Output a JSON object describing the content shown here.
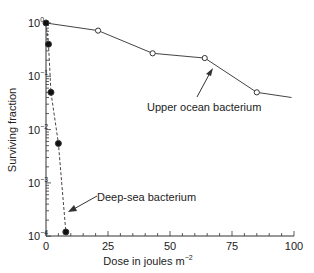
{
  "chart_data": {
    "type": "line",
    "title": "",
    "xlabel": "Dose in joules m⁻²",
    "ylabel": "Surviving fraction",
    "xlim": [
      0,
      100
    ],
    "ylim": [
      0.0001,
      1
    ],
    "yscale": "log",
    "xticks": [
      "0",
      "25",
      "50",
      "75",
      "100"
    ],
    "yticks": [
      "10^0",
      "10^-1",
      "10^-2",
      "10^-3",
      "10^-4"
    ],
    "series": [
      {
        "name": "Upper ocean bacterium",
        "style": "solid, open circles",
        "x": [
          0,
          21,
          43,
          64,
          85,
          99
        ],
        "y": [
          1.0,
          0.72,
          0.27,
          0.22,
          0.05,
          0.04
        ]
      },
      {
        "name": "Deep-sea bacterium",
        "style": "dashed, filled circles",
        "x": [
          0,
          1,
          2,
          5,
          8
        ],
        "y": [
          1.0,
          0.4,
          0.05,
          0.0055,
          0.00012
        ]
      }
    ],
    "annotations": [
      "Upper ocean bacterium",
      "Deep-sea bacterium"
    ],
    "grid": false
  },
  "labels": {
    "upper": "Upper ocean bacterium",
    "deep": "Deep-sea bacterium",
    "xlabel": "Dose in joules m",
    "xexp": "−2",
    "ylabel": "Surviving fraction"
  }
}
